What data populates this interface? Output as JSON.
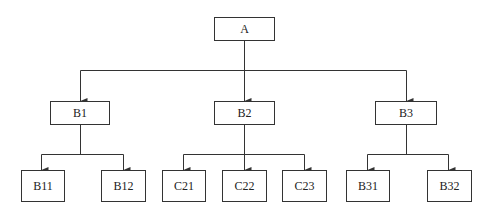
{
  "diagram": {
    "type": "tree",
    "nodes": [
      {
        "id": "A",
        "label": "A",
        "x": 214,
        "y": 17,
        "w": 61,
        "h": 24
      },
      {
        "id": "B1",
        "label": "B1",
        "x": 50,
        "y": 101,
        "w": 60,
        "h": 24
      },
      {
        "id": "B2",
        "label": "B2",
        "x": 214,
        "y": 101,
        "w": 61,
        "h": 24
      },
      {
        "id": "B3",
        "label": "B3",
        "x": 375,
        "y": 101,
        "w": 62,
        "h": 24
      },
      {
        "id": "B11",
        "label": "B11",
        "x": 21,
        "y": 170,
        "w": 44,
        "h": 32
      },
      {
        "id": "B12",
        "label": "B12",
        "x": 101,
        "y": 170,
        "w": 45,
        "h": 32
      },
      {
        "id": "C21",
        "label": "C21",
        "x": 162,
        "y": 170,
        "w": 44,
        "h": 32
      },
      {
        "id": "C22",
        "label": "C22",
        "x": 222,
        "y": 170,
        "w": 45,
        "h": 32
      },
      {
        "id": "C23",
        "label": "C23",
        "x": 282,
        "y": 170,
        "w": 45,
        "h": 32
      },
      {
        "id": "B31",
        "label": "B31",
        "x": 346,
        "y": 170,
        "w": 44,
        "h": 32
      },
      {
        "id": "B32",
        "label": "B32",
        "x": 427,
        "y": 170,
        "w": 45,
        "h": 32
      }
    ],
    "edges": [
      {
        "from": "A",
        "to": "B1"
      },
      {
        "from": "A",
        "to": "B2"
      },
      {
        "from": "A",
        "to": "B3"
      },
      {
        "from": "B1",
        "to": "B11"
      },
      {
        "from": "B1",
        "to": "B12"
      },
      {
        "from": "B2",
        "to": "C21"
      },
      {
        "from": "B2",
        "to": "C22"
      },
      {
        "from": "B2",
        "to": "C23"
      },
      {
        "from": "B3",
        "to": "B31"
      },
      {
        "from": "B3",
        "to": "B32"
      }
    ],
    "colors": {
      "line": "#333333",
      "box_border": "#333333",
      "text": "#222222"
    }
  }
}
